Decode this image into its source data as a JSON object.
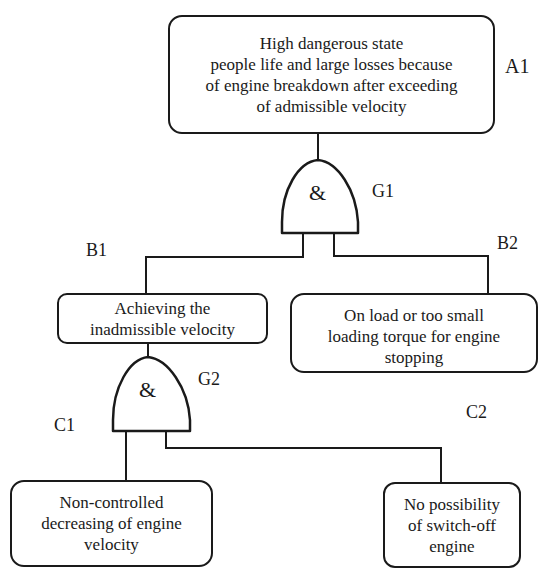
{
  "diagram": {
    "type": "fault-tree",
    "colors": {
      "stroke": "#1a1a1a",
      "background": "#ffffff"
    },
    "events": {
      "A1": {
        "id": "A1",
        "lines": [
          "High dangerous state",
          "people life and large losses because",
          "of engine breakdown after exceeding",
          "of admissible velocity"
        ]
      },
      "B1": {
        "id": "B1",
        "lines": [
          "Achieving the",
          "inadmissible velocity"
        ]
      },
      "B2": {
        "id": "B2",
        "lines": [
          "On load or too small",
          "loading torque for engine",
          "stopping"
        ]
      },
      "C1": {
        "id": "C1",
        "lines": [
          "Non-controlled",
          "decreasing of engine",
          "velocity"
        ]
      },
      "C2": {
        "id": "C2",
        "lines": [
          "No possibility",
          "of switch-off",
          "engine"
        ]
      }
    },
    "gates": {
      "G1": {
        "id": "G1",
        "symbol": "&",
        "type": "AND",
        "output": "A1",
        "inputs": [
          "B1",
          "B2"
        ]
      },
      "G2": {
        "id": "G2",
        "symbol": "&",
        "type": "AND",
        "output": "B1",
        "inputs": [
          "C1",
          "C2"
        ]
      }
    }
  }
}
